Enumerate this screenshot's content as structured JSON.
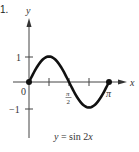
{
  "problem_number": "1.",
  "chart_data": {
    "type": "line",
    "title": "y = sin 2x",
    "xlabel": "x",
    "ylabel": "y",
    "function": "sin(2x)",
    "x_range": [
      0,
      3.14159
    ],
    "ylim": [
      -1,
      1
    ],
    "x_ticks": [
      {
        "value": 0,
        "label": "0"
      },
      {
        "value": 0.7854,
        "label": ""
      },
      {
        "value": 1.5708,
        "label": "π/2"
      },
      {
        "value": 2.3562,
        "label": ""
      },
      {
        "value": 3.14159,
        "label": "π"
      }
    ],
    "y_ticks": [
      {
        "value": 1,
        "label": "1"
      },
      {
        "value": -1,
        "label": "−1"
      }
    ],
    "points": [
      {
        "x": 0,
        "y": 0
      },
      {
        "x": 0.7854,
        "y": 1
      },
      {
        "x": 1.5708,
        "y": 0
      },
      {
        "x": 2.3562,
        "y": -1
      },
      {
        "x": 3.14159,
        "y": 0
      }
    ],
    "endpoints": [
      [
        0,
        0
      ],
      [
        3.14159,
        0
      ]
    ],
    "grid": false,
    "legend": "none"
  },
  "labels": {
    "y_axis": "y",
    "x_axis": "x",
    "origin": "0",
    "y_pos_one": "1",
    "y_neg_one": "−1",
    "pi_over_2_num": "π",
    "pi_over_2_den": "2",
    "pi": "π",
    "equation": "y = sin 2x"
  },
  "colors": {
    "curve": "#111111",
    "axis": "#333333",
    "text": "#333333"
  }
}
